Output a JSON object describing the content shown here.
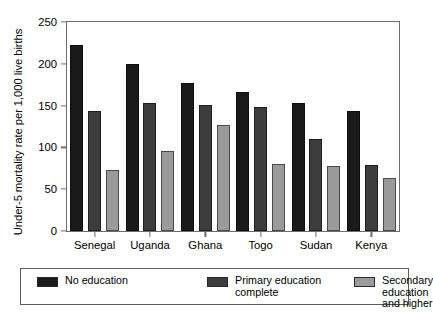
{
  "chart_data": {
    "type": "bar",
    "title": "",
    "xlabel": "",
    "ylabel": "Under-5 mortality rate per 1,000 live births",
    "ylim": [
      0,
      250
    ],
    "yticks": [
      0,
      50,
      100,
      150,
      200,
      250
    ],
    "grid": false,
    "legend_position": "bottom",
    "categories": [
      "Senegal",
      "Uganda",
      "Ghana",
      "Togo",
      "Sudan",
      "Kenya"
    ],
    "series": [
      {
        "name": "No education",
        "color": "#1a1a1a",
        "values": [
          223,
          200,
          177,
          166,
          153,
          144
        ]
      },
      {
        "name": "Primary education complete",
        "color": "#3d3d3d",
        "values": [
          144,
          153,
          151,
          148,
          110,
          79
        ]
      },
      {
        "name": "Secondary education and higher",
        "color": "#9a9a9a",
        "values": [
          73,
          96,
          127,
          80,
          78,
          63
        ]
      }
    ]
  },
  "axis": {
    "tick_labels": [
      "0",
      "50",
      "100",
      "150",
      "200",
      "250"
    ]
  },
  "legend": {
    "items": [
      {
        "label": "No education"
      },
      {
        "label": "Primary education\ncomplete"
      },
      {
        "label": "Secondary education\nand higher"
      }
    ]
  }
}
